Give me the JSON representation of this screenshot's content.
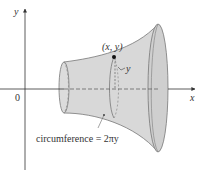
{
  "diagram": {
    "type": "surface-of-revolution",
    "axes": {
      "x_label": "x",
      "y_label": "y",
      "origin_label": "0"
    },
    "point_label": "(x, y)",
    "radius_label": "y",
    "circumference_label": "circumference = 2πy",
    "colors": {
      "surface_fill": "#d6d6d6",
      "surface_stroke": "#777777",
      "axis": "#333333",
      "point": "#111111"
    }
  }
}
